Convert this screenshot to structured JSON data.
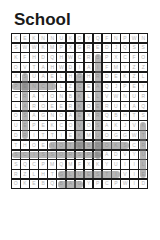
{
  "puzzle": {
    "title": "School",
    "cols": 15,
    "rows": 16,
    "grid": [
      [
        "K",
        "E",
        "K",
        "N",
        "N",
        "U",
        "K",
        "O",
        "Y",
        "Q",
        "F",
        "N",
        "P",
        "W",
        "N"
      ],
      [
        "S",
        "W",
        "W",
        "K",
        "M",
        "P",
        "X",
        "G",
        "R",
        "E",
        "D",
        "J",
        "Q",
        "S",
        "S"
      ],
      [
        "K",
        "F",
        "H",
        "D",
        "Q",
        "H",
        "W",
        "C",
        "R",
        "B",
        "P",
        "X",
        "C",
        "F",
        "O"
      ],
      [
        "O",
        "V",
        "T",
        "A",
        "H",
        "W",
        "D",
        "I",
        "A",
        "I",
        "F",
        "M",
        "Y",
        "Z",
        "Z"
      ],
      [
        "X",
        "S",
        "U",
        "A",
        "E",
        "L",
        "H",
        "G",
        "H",
        "R",
        "D",
        "E",
        "K",
        "Z",
        "L"
      ],
      [
        "P",
        "E",
        "N",
        "C",
        "I",
        "L",
        "Z",
        "C",
        "E",
        "A",
        "Q",
        "J",
        "P",
        "E",
        "Y"
      ],
      [
        "C",
        "R",
        "A",
        "Y",
        "O",
        "N",
        "B",
        "K",
        "L",
        "L",
        "V",
        "W",
        "N",
        "U",
        "R"
      ],
      [
        "L",
        "A",
        "R",
        "O",
        "E",
        "E",
        "R",
        "K",
        "O",
        "E",
        "R",
        "U",
        "X",
        "A",
        "Q"
      ],
      [
        "O",
        "S",
        "A",
        "G",
        "N",
        "O",
        "A",
        "E",
        "X",
        "R",
        "Q",
        "B",
        "H",
        "T",
        "S"
      ],
      [
        "U",
        "E",
        "P",
        "E",
        "K",
        "C",
        "O",
        "V",
        "O",
        "S",
        "A",
        "K",
        "J",
        "V",
        "K"
      ],
      [
        "D",
        "R",
        "I",
        "T",
        "T",
        "I",
        "E",
        "K",
        "M",
        "U",
        "O",
        "G",
        "G",
        "W",
        "T"
      ],
      [
        "T",
        "H",
        "O",
        "E",
        "N",
        "O",
        "T",
        "E",
        "B",
        "O",
        "O",
        "K",
        "S",
        "C",
        "R"
      ],
      [
        "S",
        "C",
        "I",
        "S",
        "S",
        "O",
        "R",
        "S",
        "P",
        "L",
        "A",
        "D",
        "V",
        "Y",
        "U"
      ],
      [
        "S",
        "Q",
        "C",
        "P",
        "M",
        "Q",
        "M",
        "F",
        "X",
        "K",
        "Y",
        "U",
        "I",
        "I",
        "L"
      ],
      [
        "R",
        "Z",
        "L",
        "H",
        "T",
        "G",
        "L",
        "U",
        "E",
        "S",
        "T",
        "I",
        "V",
        "I",
        "E"
      ],
      [
        "O",
        "K",
        "E",
        "B",
        "Q",
        "B",
        "A",
        "G",
        "Y",
        "P",
        "C",
        "P",
        "W",
        "I",
        "D"
      ]
    ],
    "found_words_highlight_color": "#787878",
    "highlights": [
      {
        "dir": "v",
        "col": 2,
        "row_start": 5,
        "row_end": 11
      },
      {
        "dir": "h",
        "row": 6,
        "col_start": 1,
        "col_end": 5
      },
      {
        "dir": "v",
        "col": 8,
        "row_start": 5,
        "row_end": 12
      },
      {
        "dir": "v",
        "col": 10,
        "row_start": 3,
        "row_end": 13
      },
      {
        "dir": "h",
        "row": 12,
        "col_start": 5,
        "col_end": 13
      },
      {
        "dir": "h",
        "row": 13,
        "col_start": 1,
        "col_end": 10
      },
      {
        "dir": "v",
        "col": 15,
        "row_start": 10,
        "row_end": 15
      },
      {
        "dir": "h",
        "row": 15,
        "col_start": 6,
        "col_end": 12
      },
      {
        "dir": "h",
        "row": 16,
        "col_start": 6,
        "col_end": 8
      }
    ]
  }
}
